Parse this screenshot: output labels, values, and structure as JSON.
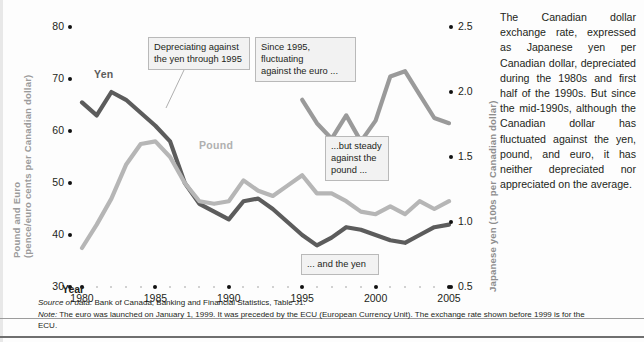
{
  "chart_data": {
    "type": "line",
    "title": "",
    "xlabel": "Year",
    "ylabel_left": "Pound and Euro (pence/euro cents per Canadian dollar)",
    "ylabel_right": "Japanese yen (100s per Canadian dollar)",
    "x": [
      1980,
      1981,
      1982,
      1983,
      1984,
      1985,
      1986,
      1987,
      1988,
      1989,
      1990,
      1991,
      1992,
      1993,
      1994,
      1995,
      1996,
      1997,
      1998,
      1999,
      2000,
      2001,
      2002,
      2003,
      2004,
      2005
    ],
    "xlim": [
      1979,
      2006
    ],
    "ylim_left": [
      30,
      80
    ],
    "ylim_right": [
      0.5,
      2.5
    ],
    "xticks": [
      1980,
      1985,
      1990,
      1995,
      2000,
      2005
    ],
    "yticks_left": [
      30,
      40,
      50,
      60,
      70,
      80
    ],
    "yticks_right": [
      0.5,
      1.0,
      1.5,
      2.0,
      2.5
    ],
    "grid": false,
    "legend": "inline-labels",
    "series": [
      {
        "name": "Yen",
        "color": "#5c5c5c",
        "axis": "right",
        "label_x": 1982.6,
        "label_y": 70.5,
        "values_left_scale": [
          65.5,
          63.0,
          67.5,
          66.0,
          63.5,
          61.0,
          58.0,
          50.0,
          46.0,
          44.5,
          43.0,
          46.5,
          47.0,
          45.0,
          42.5,
          40.0,
          38.0,
          39.5,
          41.5,
          41.0,
          40.0,
          39.0,
          38.5,
          40.0,
          41.5,
          42.0
        ]
      },
      {
        "name": "Pound",
        "color": "#b6b6b6",
        "axis": "left",
        "label_x": 1989.0,
        "label_y": 53.5,
        "values_left_scale": [
          37.5,
          42.0,
          47.0,
          53.5,
          57.5,
          58.0,
          55.0,
          50.0,
          46.5,
          46.0,
          46.5,
          50.5,
          48.5,
          47.5,
          49.5,
          51.5,
          48.0,
          48.0,
          46.5,
          44.5,
          44.0,
          45.5,
          44.0,
          46.5,
          45.0,
          46.5
        ]
      },
      {
        "name": "Euro",
        "color": "#9a9a9a",
        "axis": "left",
        "label_x": 1996.0,
        "label_y": 67.0,
        "values_left_scale": [
          null,
          null,
          null,
          null,
          null,
          null,
          null,
          null,
          null,
          null,
          null,
          null,
          null,
          null,
          null,
          66.0,
          61.5,
          58.5,
          63.0,
          58.0,
          62.0,
          70.5,
          71.5,
          67.0,
          62.5,
          61.5,
          66.0
        ]
      }
    ],
    "annotations": [
      {
        "id": "yen-callout",
        "text": "Depreciating against\nthe yen through 1995"
      },
      {
        "id": "euro-callout",
        "text": "Since 1995, fluctuating\nagainst the euro ..."
      },
      {
        "id": "pound-callout",
        "text": "...but  steady\nagainst the\npound ..."
      },
      {
        "id": "yen-bottom-callout",
        "text": "... and the yen"
      }
    ]
  },
  "axes": {
    "left_title": "Pound and Euro\n(pence/euro cents per Canadian dollar)",
    "right_title": "Japanese yen (100s per Canadian dollar)",
    "x_title": "Year",
    "left_ticks": [
      "80",
      "70",
      "60",
      "50",
      "40",
      "30"
    ],
    "right_ticks": [
      "2.5",
      "2.0",
      "1.5",
      "1.0",
      "0.5"
    ],
    "x_ticks": [
      "1980",
      "1985",
      "1990",
      "1995",
      "2000",
      "2005"
    ]
  },
  "series_labels": {
    "yen": "Yen",
    "pound": "Pound",
    "euro": "Euro"
  },
  "callouts": {
    "yen_top": "Depreciating against\nthe yen through 1995",
    "euro": "Since 1995, fluctuating\nagainst the euro ...",
    "pound": "...but  steady\nagainst the\npound ...",
    "yen_bottom": "... and the yen"
  },
  "sidebar": {
    "text": "The Canadian dollar exchange rate, expressed as Japanese yen per Canadian dollar, depreciated during the 1980s and first half of the 1990s. But since the mid-1990s, although the Canadian dollar has fluctuated against the yen, pound, and euro, it has neither depreciated nor appreciated on the average."
  },
  "footnotes": {
    "source_lead": "Source of data:",
    "source_text": " Bank of Canada, Banking and Financial Statistics, Table J1.",
    "note_lead": "Note:",
    "note_text": " The euro was launched on January 1, 1999. It was preceded by the ECU (European Currency Unit). The exchange rate shown before 1999 is for the ECU."
  },
  "colors": {
    "yen": "#5c5c5c",
    "pound": "#b6b6b6",
    "euro": "#9a9a9a",
    "axis_label": "#9b9b9b",
    "text": "#231f20"
  }
}
